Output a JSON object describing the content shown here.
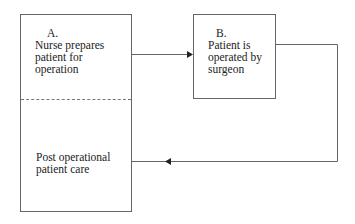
{
  "diagram": {
    "type": "flowchart",
    "nodes": [
      {
        "id": "A",
        "label": "A.",
        "text_lines": [
          "Nurse prepares",
          "patient for",
          "operation"
        ]
      },
      {
        "id": "B",
        "label": "B.",
        "text_lines": [
          "Patient is",
          "operated by",
          "surgeon"
        ]
      },
      {
        "id": "C",
        "label": "",
        "text_lines": [
          "Post operational",
          "patient care"
        ]
      }
    ],
    "edges": [
      {
        "from": "A",
        "to": "B",
        "style": "arrow"
      },
      {
        "from": "B",
        "to": "C",
        "style": "arrow"
      }
    ]
  },
  "nodes": {
    "a": {
      "label": "A.",
      "l1": "Nurse prepares",
      "l2": "patient for",
      "l3": "operation"
    },
    "b": {
      "label": "B.",
      "l1": "Patient is",
      "l2": "operated by",
      "l3": "surgeon"
    },
    "c": {
      "l1": "Post operational",
      "l2": "patient care"
    }
  },
  "colors": {
    "line": "#666666",
    "text": "#222222",
    "background": "#ffffff"
  }
}
